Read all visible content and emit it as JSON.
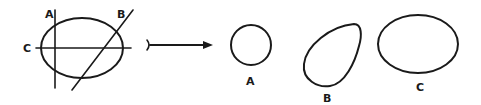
{
  "diagram": {
    "source": {
      "labels": {
        "a": "A",
        "b": "B",
        "c": "C"
      }
    },
    "arrow": {
      "direction": "right"
    },
    "sections": [
      {
        "id": "A",
        "label": "A",
        "shape": "circle"
      },
      {
        "id": "B",
        "label": "B",
        "shape": "egg"
      },
      {
        "id": "C",
        "label": "C",
        "shape": "ellipse"
      }
    ],
    "colors": {
      "ink": "#1a1a1a",
      "background": "#ffffff"
    }
  }
}
